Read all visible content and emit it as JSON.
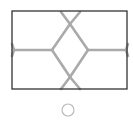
{
  "figure": {
    "frame_color": "#333333",
    "line_color": "#aaaaaa"
  },
  "indicator": {
    "shape": "circle-outline",
    "color": "#bbbbbb"
  }
}
